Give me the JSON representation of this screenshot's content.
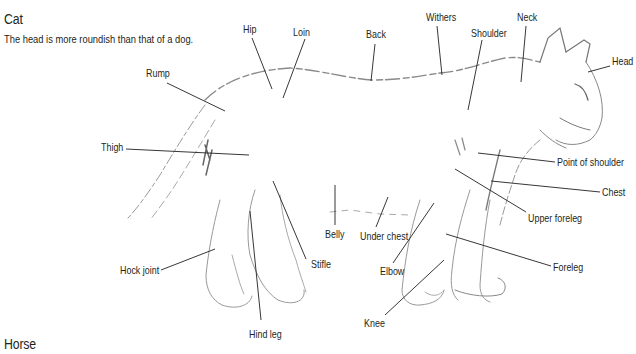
{
  "section_title": "Cat",
  "description": "The head is more roundish than that of a dog.",
  "next_section_title": "Horse",
  "colors": {
    "text": "#231f20",
    "leader_line": "#231f20",
    "sketch": "#9a9a9a"
  },
  "labels": [
    {
      "id": "hip",
      "text": "Hip",
      "x": 243,
      "y": 24
    },
    {
      "id": "loin",
      "text": "Loin",
      "x": 293,
      "y": 27
    },
    {
      "id": "back",
      "text": "Back",
      "x": 366,
      "y": 29
    },
    {
      "id": "withers",
      "text": "Withers",
      "x": 426,
      "y": 12
    },
    {
      "id": "shoulder",
      "text": "Shoulder",
      "x": 471,
      "y": 28
    },
    {
      "id": "neck",
      "text": "Neck",
      "x": 517,
      "y": 12
    },
    {
      "id": "head",
      "text": "Head",
      "x": 612,
      "y": 56
    },
    {
      "id": "rump",
      "text": "Rump",
      "x": 146,
      "y": 68
    },
    {
      "id": "thigh",
      "text": "Thigh",
      "x": 101,
      "y": 142
    },
    {
      "id": "point-of-shoulder",
      "text": "Point of shoulder",
      "x": 557,
      "y": 157
    },
    {
      "id": "chest",
      "text": "Chest",
      "x": 602,
      "y": 187
    },
    {
      "id": "upper-foreleg",
      "text": "Upper foreleg",
      "x": 528,
      "y": 213
    },
    {
      "id": "belly",
      "text": "Belly",
      "x": 325,
      "y": 229
    },
    {
      "id": "under-chest",
      "text": "Under chest",
      "x": 360,
      "y": 231
    },
    {
      "id": "stifle",
      "text": "Stifle",
      "x": 311,
      "y": 259
    },
    {
      "id": "elbow",
      "text": "Elbow",
      "x": 380,
      "y": 266
    },
    {
      "id": "foreleg",
      "text": "Foreleg",
      "x": 553,
      "y": 262
    },
    {
      "id": "hock-joint",
      "text": "Hock joint",
      "x": 120,
      "y": 265
    },
    {
      "id": "hind-leg",
      "text": "Hind leg",
      "x": 249,
      "y": 329
    },
    {
      "id": "knee",
      "text": "Knee",
      "x": 364,
      "y": 318
    }
  ]
}
